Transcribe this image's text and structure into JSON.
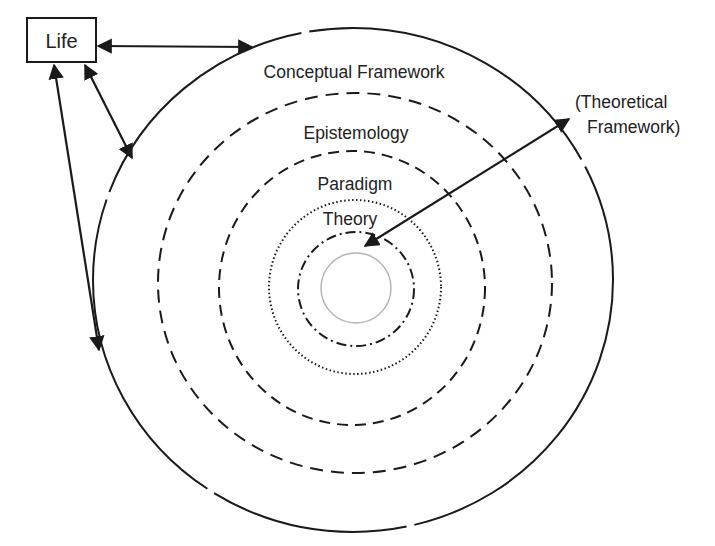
{
  "diagram": {
    "life_box": {
      "label": "Life"
    },
    "rings": [
      {
        "id": "conceptual-framework",
        "label": "Conceptual Framework",
        "style": "solid"
      },
      {
        "id": "epistemology",
        "label": "Epistemology",
        "style": "dashed"
      },
      {
        "id": "paradigm",
        "label": "Paradigm",
        "style": "dashed"
      },
      {
        "id": "theory",
        "label": "Theory",
        "style": "dotted"
      },
      {
        "id": "inner-dash-dot",
        "label": "",
        "style": "dash-dot"
      },
      {
        "id": "core",
        "label": "",
        "style": "solid-grey"
      }
    ],
    "external_label": {
      "line1": "(Theoretical",
      "line2": "Framework)"
    },
    "colors": {
      "stroke": "#1a1a1a",
      "core_stroke": "#b5b5b5",
      "background": "#ffffff"
    }
  }
}
